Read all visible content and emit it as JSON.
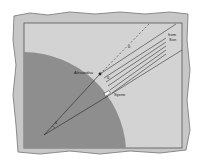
{
  "figure": {
    "labels": {
      "alexandria": "Alexandria",
      "syene": "Syene",
      "sun_line1": "from",
      "sun_line2": "Sun",
      "angle_center": "θ",
      "angle_alexandria": "θ",
      "angle_top": "θ"
    },
    "colors": {
      "paper": "#c9c9c9",
      "paper_edge": "#9a9a9a",
      "frame_fill": "#d2d2d2",
      "earth": "#8f8f8f",
      "lines": "#333333"
    }
  }
}
